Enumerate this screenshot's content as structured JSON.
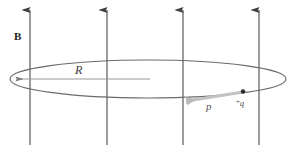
{
  "figure": {
    "kind": "physics-diagram",
    "background_color": "#ffffff",
    "width": 294,
    "height": 152
  },
  "labels": {
    "field": "B",
    "radius": "R",
    "momentum": "p",
    "charge_sign": "+",
    "charge_symbol": "q"
  },
  "colors": {
    "field_line": "#4a4a4a",
    "loop": "#6b6b6b",
    "radius_line": "#8a8a8a",
    "momentum_arrow": "#b5b5b5",
    "charge_dot": "#2b2b2b",
    "text": "#2b2b2b"
  },
  "field_lines": {
    "count": 4,
    "direction": "up",
    "x_positions": [
      30,
      107,
      183,
      259
    ],
    "y_top": 10,
    "y_bottom": 145
  },
  "loop": {
    "center_x": 148,
    "center_y": 79,
    "radius_x": 138,
    "radius_y": 19
  },
  "radius_vector": {
    "from_x": 150,
    "from_y": 79,
    "to_x": 12,
    "to_y": 79,
    "arrowhead": "left"
  },
  "momentum_vector": {
    "from_x": 243,
    "from_y": 92,
    "to_x": 180,
    "to_y": 102,
    "arrowhead": "left"
  },
  "charge_point": {
    "x": 243,
    "y": 92
  }
}
